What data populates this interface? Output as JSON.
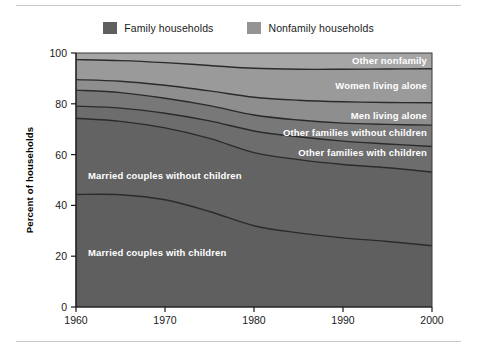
{
  "legend": {
    "items": [
      {
        "label": "Family households",
        "color": "#5f5f5f",
        "name": "legend-family"
      },
      {
        "label": "Nonfamily households",
        "color": "#949494",
        "name": "legend-nonfamily"
      }
    ]
  },
  "chart_data": {
    "type": "area",
    "title": "",
    "subtitle": "",
    "xlabel": "",
    "ylabel": "Percent of households",
    "xlim": [
      1960,
      2000
    ],
    "ylim": [
      0,
      100
    ],
    "xticks": [
      "1960",
      "1970",
      "1980",
      "1990",
      "2000"
    ],
    "yticks": [
      "0",
      "20",
      "40",
      "60",
      "80",
      "100"
    ],
    "grid": false,
    "legend_position": "top-center",
    "stacked": true,
    "stack_order": "bottom-to-top",
    "x": [
      1960,
      1965,
      1970,
      1975,
      1980,
      1985,
      1990,
      1995,
      2000
    ],
    "series": [
      {
        "name": "Married couples with children",
        "group": "Family households",
        "color": "#5f5f5f",
        "label": "Married couples with children",
        "cumulative_top": [
          44.3,
          44.2,
          42.2,
          37.6,
          32.0,
          29.2,
          27.2,
          25.8,
          24.1
        ],
        "values": [
          44.3,
          44.2,
          42.2,
          37.6,
          32.0,
          29.2,
          27.2,
          25.8,
          24.1
        ]
      },
      {
        "name": "Married couples without children",
        "group": "Family households",
        "color": "#636363",
        "label": "Married couples without children",
        "cumulative_top": [
          74.3,
          73.1,
          70.5,
          66.4,
          60.8,
          58.0,
          56.1,
          54.8,
          53.1
        ],
        "values": [
          30.0,
          28.9,
          28.3,
          28.8,
          28.8,
          28.8,
          28.9,
          29.0,
          29.0
        ]
      },
      {
        "name": "Other families with children",
        "group": "Family households",
        "color": "#6d6d6d",
        "label": "Other families with children",
        "cumulative_top": [
          79.1,
          78.3,
          76.3,
          73.3,
          69.3,
          67.0,
          65.3,
          64.2,
          63.2
        ],
        "values": [
          4.8,
          5.2,
          5.8,
          6.9,
          8.5,
          9.0,
          9.2,
          9.4,
          10.1
        ]
      },
      {
        "name": "Other families without children",
        "group": "Family households",
        "color": "#787878",
        "label": "Other families without children",
        "cumulative_top": [
          85.4,
          84.4,
          82.2,
          79.3,
          75.6,
          73.6,
          72.4,
          71.9,
          71.6
        ],
        "values": [
          6.3,
          6.1,
          5.9,
          6.0,
          6.3,
          6.6,
          7.1,
          7.7,
          8.4
        ]
      },
      {
        "name": "Men living alone",
        "group": "Nonfamily households",
        "color": "#8e8e8e",
        "label": "Men living alone",
        "cumulative_top": [
          89.5,
          88.9,
          87.3,
          85.1,
          82.6,
          81.4,
          80.8,
          80.5,
          80.4
        ],
        "values": [
          4.1,
          4.5,
          5.1,
          5.8,
          7.0,
          7.8,
          8.4,
          8.6,
          8.8
        ]
      },
      {
        "name": "Women living alone",
        "group": "Nonfamily households",
        "color": "#9a9a9a",
        "label": "Women living alone",
        "cumulative_top": [
          97.4,
          97.0,
          96.2,
          95.1,
          94.0,
          93.6,
          93.6,
          93.7,
          93.8
        ],
        "values": [
          7.9,
          8.1,
          8.9,
          10.0,
          11.4,
          12.2,
          12.8,
          13.2,
          13.4
        ]
      },
      {
        "name": "Other nonfamily",
        "group": "Nonfamily households",
        "color": "#a6a6a6",
        "label": "Other nonfamily",
        "cumulative_top": [
          100,
          100,
          100,
          100,
          100,
          100,
          100,
          100,
          100
        ],
        "values": [
          2.6,
          3.0,
          3.8,
          4.9,
          6.0,
          6.4,
          6.4,
          6.3,
          6.2
        ]
      }
    ]
  },
  "colors": {
    "family": "#5f5f5f",
    "nonfamily": "#949494",
    "axis": "#1a1a1a",
    "boundary": "#2b2b2b",
    "label_text": "#ffffff",
    "rule": "#c9c9c9"
  }
}
